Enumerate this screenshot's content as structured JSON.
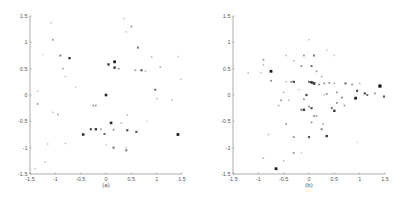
{
  "chart_data": [
    {
      "type": "scatter",
      "panel_label": "(a)",
      "title": "",
      "xlabel": "(a)",
      "ylabel": "",
      "xlim": [
        -1.5,
        1.5
      ],
      "ylim": [
        -1.5,
        1.5
      ],
      "xticks": [
        "-1.5",
        "-1",
        "-0.5",
        "0",
        "0.5",
        "1",
        "1.5"
      ],
      "yticks": [
        "1.5",
        "1",
        "0.5",
        "0",
        "-0.5",
        "-1",
        "-1.5"
      ],
      "grid": false,
      "legend": null,
      "points": [
        {
          "x": 0.17,
          "y": 0.63,
          "g": 30,
          "s": 1.4
        },
        {
          "x": 0.05,
          "y": 0.58,
          "g": 60,
          "s": 1.2
        },
        {
          "x": 0.17,
          "y": 0.52,
          "g": 50,
          "s": 1.2
        },
        {
          "x": 0.25,
          "y": 0.5,
          "g": 150,
          "s": 0.9
        },
        {
          "x": -0.72,
          "y": 0.7,
          "g": 60,
          "s": 1.2
        },
        {
          "x": -0.9,
          "y": 0.75,
          "g": 130,
          "s": 1.0
        },
        {
          "x": -0.85,
          "y": 0.5,
          "g": 170,
          "s": 0.9
        },
        {
          "x": -1.05,
          "y": 1.05,
          "g": 150,
          "s": 0.9
        },
        {
          "x": -1.08,
          "y": 1.37,
          "g": 200,
          "s": 0.8
        },
        {
          "x": 0.63,
          "y": 0.9,
          "g": 120,
          "s": 1.0
        },
        {
          "x": 0.5,
          "y": 1.3,
          "g": 150,
          "s": 0.9
        },
        {
          "x": 0.35,
          "y": 1.45,
          "g": 200,
          "s": 0.8
        },
        {
          "x": 0.4,
          "y": 1.2,
          "g": 200,
          "s": 0.8
        },
        {
          "x": 0.7,
          "y": 0.47,
          "g": 90,
          "s": 1.1
        },
        {
          "x": 0.58,
          "y": 0.47,
          "g": 160,
          "s": 0.9
        },
        {
          "x": 0.78,
          "y": 0.45,
          "g": 180,
          "s": 0.8
        },
        {
          "x": 0.9,
          "y": 0.72,
          "g": 180,
          "s": 0.8
        },
        {
          "x": 1.07,
          "y": 0.53,
          "g": 170,
          "s": 0.8
        },
        {
          "x": 1.42,
          "y": 0.73,
          "g": 200,
          "s": 0.8
        },
        {
          "x": 0.97,
          "y": 0.1,
          "g": 110,
          "s": 1.0
        },
        {
          "x": 1.0,
          "y": -0.07,
          "g": 190,
          "s": 0.8
        },
        {
          "x": 1.48,
          "y": 0.3,
          "g": 200,
          "s": 0.8
        },
        {
          "x": 1.3,
          "y": -0.1,
          "g": 200,
          "s": 0.8
        },
        {
          "x": 0.0,
          "y": 0.0,
          "g": 40,
          "s": 1.3
        },
        {
          "x": -0.25,
          "y": -0.2,
          "g": 150,
          "s": 0.9
        },
        {
          "x": -0.2,
          "y": -0.2,
          "g": 160,
          "s": 0.9
        },
        {
          "x": 0.1,
          "y": -0.53,
          "g": 40,
          "s": 1.3
        },
        {
          "x": 0.3,
          "y": -0.53,
          "g": 190,
          "s": 0.8
        },
        {
          "x": 0.42,
          "y": -0.38,
          "g": 190,
          "s": 0.8
        },
        {
          "x": -0.45,
          "y": -0.75,
          "g": 50,
          "s": 1.3
        },
        {
          "x": -0.2,
          "y": -0.65,
          "g": 60,
          "s": 1.2
        },
        {
          "x": -0.3,
          "y": -0.65,
          "g": 80,
          "s": 1.1
        },
        {
          "x": -0.1,
          "y": -0.65,
          "g": 170,
          "s": 0.9
        },
        {
          "x": -0.03,
          "y": -0.74,
          "g": 100,
          "s": 1.0
        },
        {
          "x": 0.15,
          "y": -0.66,
          "g": 140,
          "s": 0.9
        },
        {
          "x": 0.42,
          "y": -0.67,
          "g": 80,
          "s": 1.1
        },
        {
          "x": 0.6,
          "y": -0.7,
          "g": 90,
          "s": 1.1
        },
        {
          "x": 1.42,
          "y": -0.75,
          "g": 30,
          "s": 1.4
        },
        {
          "x": 0.15,
          "y": -1.0,
          "g": 110,
          "s": 1.0
        },
        {
          "x": 0.4,
          "y": -1.05,
          "g": 110,
          "s": 1.0
        },
        {
          "x": 0.4,
          "y": -1.0,
          "g": 190,
          "s": 0.8
        },
        {
          "x": -0.95,
          "y": -0.37,
          "g": 170,
          "s": 0.9
        },
        {
          "x": -1.35,
          "y": -0.17,
          "g": 160,
          "s": 0.9
        },
        {
          "x": -1.35,
          "y": 0.07,
          "g": 200,
          "s": 0.8
        },
        {
          "x": -1.05,
          "y": -0.33,
          "g": 200,
          "s": 0.8
        },
        {
          "x": -0.8,
          "y": 0.35,
          "g": 200,
          "s": 0.8
        },
        {
          "x": -0.8,
          "y": -0.92,
          "g": 190,
          "s": 0.8
        },
        {
          "x": -1.15,
          "y": -0.93,
          "g": 200,
          "s": 0.8
        },
        {
          "x": -1.2,
          "y": -1.27,
          "g": 200,
          "s": 0.8
        },
        {
          "x": -1.4,
          "y": -1.4,
          "g": 200,
          "s": 0.8
        },
        {
          "x": -1.25,
          "y": 0.77,
          "g": 210,
          "s": 0.8
        },
        {
          "x": -0.6,
          "y": 0.15,
          "g": 210,
          "s": 0.8
        },
        {
          "x": 0.0,
          "y": -0.95,
          "g": 210,
          "s": 0.8
        },
        {
          "x": 0.8,
          "y": -0.5,
          "g": 210,
          "s": 0.8
        }
      ]
    },
    {
      "type": "scatter",
      "panel_label": "(b)",
      "title": "",
      "xlabel": "(b)",
      "ylabel": "",
      "xlim": [
        -1.5,
        1.5
      ],
      "ylim": [
        -1.5,
        1.5
      ],
      "xticks": [
        "-1.5",
        "-1",
        "-0.5",
        "0",
        "0.5",
        "1",
        "1.5"
      ],
      "yticks": [
        "1.5",
        "1",
        "0.5",
        "0",
        "-0.5",
        "-1",
        "-1.5"
      ],
      "grid": false,
      "legend": null,
      "points": [
        {
          "x": -0.75,
          "y": 0.45,
          "g": 30,
          "s": 1.4
        },
        {
          "x": -0.75,
          "y": 0.27,
          "g": 140,
          "s": 0.9
        },
        {
          "x": -0.9,
          "y": 0.67,
          "g": 160,
          "s": 0.9
        },
        {
          "x": -0.9,
          "y": 0.57,
          "g": 180,
          "s": 0.8
        },
        {
          "x": -1.2,
          "y": 0.42,
          "g": 200,
          "s": 0.8
        },
        {
          "x": -0.65,
          "y": -1.4,
          "g": 30,
          "s": 1.4
        },
        {
          "x": 1.4,
          "y": 0.17,
          "g": 20,
          "s": 1.6
        },
        {
          "x": 0.92,
          "y": -0.06,
          "g": 30,
          "s": 1.4
        },
        {
          "x": 1.48,
          "y": -0.03,
          "g": 90,
          "s": 1.1
        },
        {
          "x": 0.95,
          "y": 0.08,
          "g": 80,
          "s": 1.1
        },
        {
          "x": 1.1,
          "y": 0.03,
          "g": 80,
          "s": 1.1
        },
        {
          "x": 1.15,
          "y": 0.0,
          "g": 110,
          "s": 1.0
        },
        {
          "x": 1.3,
          "y": 0.03,
          "g": 150,
          "s": 0.9
        },
        {
          "x": 0.72,
          "y": 0.22,
          "g": 100,
          "s": 1.0
        },
        {
          "x": 0.85,
          "y": 0.2,
          "g": 150,
          "s": 0.9
        },
        {
          "x": 1.0,
          "y": 0.22,
          "g": 180,
          "s": 0.8
        },
        {
          "x": 0.05,
          "y": 0.24,
          "g": 40,
          "s": 1.3
        },
        {
          "x": 0.1,
          "y": 0.22,
          "g": 50,
          "s": 1.3
        },
        {
          "x": 0.0,
          "y": 0.25,
          "g": 110,
          "s": 1.0
        },
        {
          "x": -0.3,
          "y": 0.25,
          "g": 70,
          "s": 1.1
        },
        {
          "x": -0.35,
          "y": 0.25,
          "g": 140,
          "s": 0.9
        },
        {
          "x": -0.45,
          "y": 0.25,
          "g": 190,
          "s": 0.8
        },
        {
          "x": 0.2,
          "y": 0.2,
          "g": 140,
          "s": 0.9
        },
        {
          "x": 0.3,
          "y": 0.22,
          "g": 150,
          "s": 0.9
        },
        {
          "x": 0.4,
          "y": 0.23,
          "g": 150,
          "s": 0.9
        },
        {
          "x": 0.5,
          "y": 0.22,
          "g": 170,
          "s": 0.8
        },
        {
          "x": 0.05,
          "y": 0.55,
          "g": 110,
          "s": 1.0
        },
        {
          "x": 0.1,
          "y": 0.75,
          "g": 120,
          "s": 1.0
        },
        {
          "x": -0.1,
          "y": 0.75,
          "g": 150,
          "s": 0.9
        },
        {
          "x": -0.15,
          "y": 0.55,
          "g": 140,
          "s": 0.9
        },
        {
          "x": 0.15,
          "y": 0.45,
          "g": 160,
          "s": 0.9
        },
        {
          "x": 0.25,
          "y": 0.35,
          "g": 170,
          "s": 0.8
        },
        {
          "x": -0.3,
          "y": 0.65,
          "g": 190,
          "s": 0.8
        },
        {
          "x": -0.45,
          "y": 0.75,
          "g": 190,
          "s": 0.8
        },
        {
          "x": 0.0,
          "y": 1.05,
          "g": 200,
          "s": 0.8
        },
        {
          "x": 0.35,
          "y": 0.85,
          "g": 200,
          "s": 0.8
        },
        {
          "x": 0.5,
          "y": 0.75,
          "g": 200,
          "s": 0.8
        },
        {
          "x": -0.05,
          "y": 0.0,
          "g": 80,
          "s": 1.1
        },
        {
          "x": -0.1,
          "y": -0.08,
          "g": 150,
          "s": 0.9
        },
        {
          "x": 0.35,
          "y": 0.02,
          "g": 150,
          "s": 0.9
        },
        {
          "x": 0.55,
          "y": 0.05,
          "g": 150,
          "s": 0.9
        },
        {
          "x": 0.65,
          "y": -0.05,
          "g": 140,
          "s": 0.9
        },
        {
          "x": 0.7,
          "y": -0.2,
          "g": 160,
          "s": 0.9
        },
        {
          "x": -0.1,
          "y": -0.28,
          "g": 60,
          "s": 1.2
        },
        {
          "x": -0.15,
          "y": -0.28,
          "g": 120,
          "s": 1.0
        },
        {
          "x": 0.05,
          "y": -0.25,
          "g": 80,
          "s": 1.1
        },
        {
          "x": 0.0,
          "y": -0.22,
          "g": 150,
          "s": 0.9
        },
        {
          "x": 0.5,
          "y": -0.3,
          "g": 60,
          "s": 1.2
        },
        {
          "x": 0.45,
          "y": -0.25,
          "g": 110,
          "s": 1.0
        },
        {
          "x": 0.55,
          "y": -0.15,
          "g": 150,
          "s": 0.9
        },
        {
          "x": 0.1,
          "y": -0.4,
          "g": 140,
          "s": 0.9
        },
        {
          "x": 0.15,
          "y": -0.4,
          "g": 160,
          "s": 0.9
        },
        {
          "x": 0.05,
          "y": -0.52,
          "g": 150,
          "s": 0.9
        },
        {
          "x": 0.35,
          "y": -0.78,
          "g": 60,
          "s": 1.2
        },
        {
          "x": 0.25,
          "y": -0.65,
          "g": 130,
          "s": 1.0
        },
        {
          "x": 0.28,
          "y": -0.55,
          "g": 170,
          "s": 0.8
        },
        {
          "x": 0.0,
          "y": -0.8,
          "g": 90,
          "s": 1.1
        },
        {
          "x": -0.3,
          "y": -0.8,
          "g": 140,
          "s": 0.9
        },
        {
          "x": -0.3,
          "y": -1.1,
          "g": 150,
          "s": 0.9
        },
        {
          "x": -0.45,
          "y": -0.55,
          "g": 160,
          "s": 0.9
        },
        {
          "x": -0.55,
          "y": -0.1,
          "g": 150,
          "s": 0.9
        },
        {
          "x": -0.6,
          "y": -0.2,
          "g": 170,
          "s": 0.8
        },
        {
          "x": -0.5,
          "y": 0.05,
          "g": 180,
          "s": 0.8
        },
        {
          "x": -0.4,
          "y": -0.1,
          "g": 180,
          "s": 0.8
        },
        {
          "x": -0.9,
          "y": -1.2,
          "g": 170,
          "s": 0.8
        },
        {
          "x": -0.8,
          "y": -0.75,
          "g": 190,
          "s": 0.8
        },
        {
          "x": -0.5,
          "y": -1.25,
          "g": 190,
          "s": 0.8
        },
        {
          "x": -0.15,
          "y": -1.1,
          "g": 200,
          "s": 0.8
        },
        {
          "x": 0.95,
          "y": -0.9,
          "g": 210,
          "s": 0.8
        },
        {
          "x": 0.3,
          "y": 0.0,
          "g": 200,
          "s": 0.8
        },
        {
          "x": -0.2,
          "y": 0.1,
          "g": 200,
          "s": 0.8
        },
        {
          "x": -0.95,
          "y": 0.42,
          "g": 200,
          "s": 0.8
        }
      ]
    }
  ]
}
